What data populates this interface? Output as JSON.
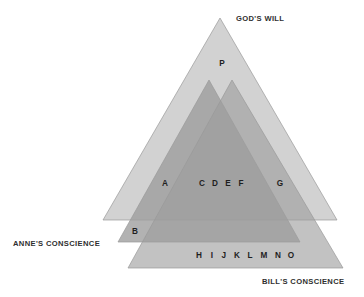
{
  "diagram": {
    "title_labels": [
      {
        "id": "gods-will",
        "text": "GOD'S WILL",
        "x": 236,
        "y": 21,
        "anchor": "start"
      },
      {
        "id": "annes-conscience",
        "text": "ANNE'S CONSCIENCE",
        "x": 13,
        "y": 246,
        "anchor": "start"
      },
      {
        "id": "bills-conscience",
        "text": "BILL'S CONSCIENCE",
        "x": 262,
        "y": 284,
        "anchor": "start"
      }
    ],
    "shapes": [
      {
        "id": "gods-will-triangle",
        "name": "God's Will",
        "points": "220,18 337,220 103,220",
        "fill": "#d2d2d2",
        "opacity": 1
      },
      {
        "id": "annes-conscience-triangle",
        "name": "Anne's Conscience",
        "points": "209,80 300,242 118,242",
        "fill": "#9c9c9c",
        "opacity": 0.78
      },
      {
        "id": "bills-conscience-triangle",
        "name": "Bill's Conscience",
        "points": "232,80 343,268 128,268",
        "fill": "#9c9c9c",
        "opacity": 0.62
      }
    ],
    "region_letters": [
      {
        "id": "letter-p",
        "text": "P",
        "x": 222,
        "y": 66
      },
      {
        "id": "letter-a",
        "text": "A",
        "x": 165,
        "y": 186
      },
      {
        "id": "letter-c",
        "text": "C",
        "x": 202,
        "y": 186
      },
      {
        "id": "letter-d",
        "text": "D",
        "x": 215,
        "y": 186
      },
      {
        "id": "letter-e",
        "text": "E",
        "x": 228,
        "y": 186
      },
      {
        "id": "letter-f",
        "text": "F",
        "x": 241,
        "y": 186
      },
      {
        "id": "letter-g",
        "text": "G",
        "x": 280,
        "y": 186
      },
      {
        "id": "letter-b",
        "text": "B",
        "x": 135,
        "y": 234
      },
      {
        "id": "letter-h",
        "text": "H",
        "x": 199,
        "y": 258
      },
      {
        "id": "letter-i",
        "text": "I",
        "x": 212,
        "y": 258
      },
      {
        "id": "letter-j",
        "text": "J",
        "x": 224,
        "y": 258
      },
      {
        "id": "letter-k",
        "text": "K",
        "x": 237,
        "y": 258
      },
      {
        "id": "letter-l",
        "text": "L",
        "x": 250,
        "y": 258
      },
      {
        "id": "letter-m",
        "text": "M",
        "x": 264,
        "y": 258
      },
      {
        "id": "letter-n",
        "text": "N",
        "x": 278,
        "y": 258
      },
      {
        "id": "letter-o",
        "text": "O",
        "x": 291,
        "y": 258
      }
    ],
    "colors": {
      "background": "#ffffff",
      "light_gray": "#d2d2d2",
      "mid_gray": "#b0b0b0",
      "dark_gray": "#868686",
      "outline": "#9a9a9a",
      "text": "#2f2f2f"
    }
  }
}
